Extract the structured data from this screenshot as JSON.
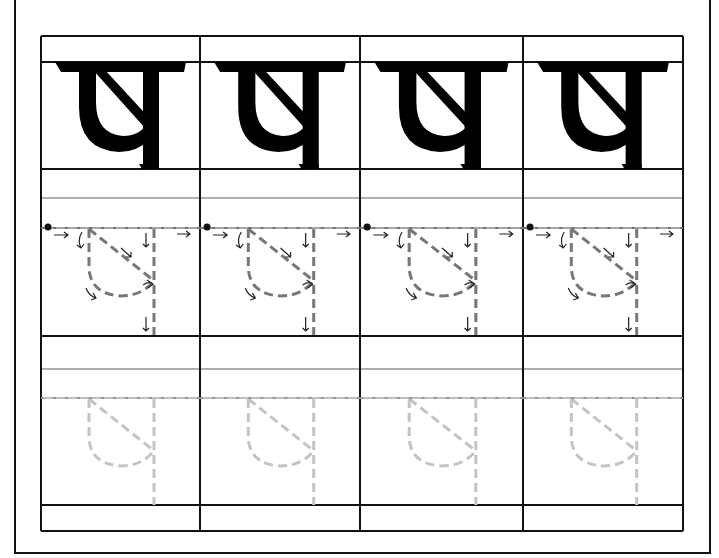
{
  "worksheet": {
    "letter": "ष",
    "letter_name": "sha (retroflex)",
    "columns": 4,
    "column_edges": [
      41,
      200,
      360,
      523,
      683
    ],
    "rows": {
      "grid_top": 36,
      "model_top": 62,
      "model_bottom": 169,
      "guide_gray_1": 198,
      "trace_top": 228,
      "trace_bottom": 336,
      "guide_gray_2": 369,
      "practice_top": 398,
      "practice_bottom": 505,
      "grid_bottom": 531
    },
    "colors": {
      "line": "#111111",
      "guide_gray": "#b0b0b0",
      "trace_dash": "#777777",
      "practice_dash": "#c4c4c4",
      "arrow": "#222222",
      "glyph": "#000000"
    },
    "rows_meta": [
      {
        "name": "model-row",
        "description": "solid letter models"
      },
      {
        "name": "trace-row",
        "description": "dashed stroke guide with direction arrows"
      },
      {
        "name": "practice-row",
        "description": "faint dashed letter for tracing"
      }
    ]
  }
}
